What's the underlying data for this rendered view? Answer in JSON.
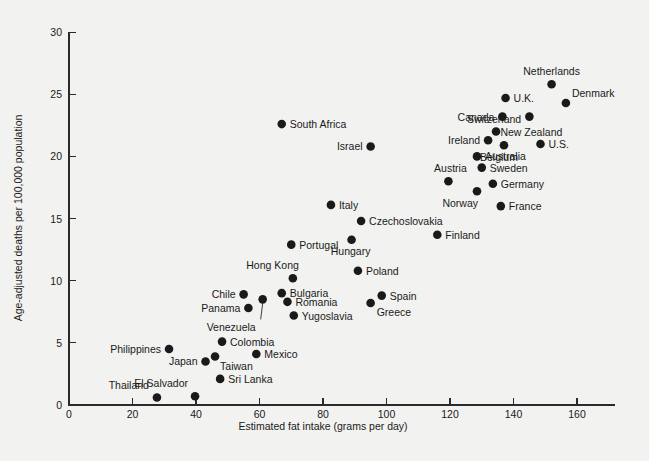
{
  "chart_data": {
    "type": "scatter",
    "title": "",
    "xlabel": "Estimated fat intake (grams per day)",
    "ylabel": "Age-adjusted deaths per 100,000 population",
    "xlim": [
      0,
      172
    ],
    "ylim": [
      0,
      30
    ],
    "xticks": [
      0,
      20,
      40,
      60,
      80,
      100,
      120,
      140,
      160
    ],
    "yticks": [
      0,
      5,
      10,
      15,
      20,
      25,
      30
    ],
    "grid": false,
    "legend": "none",
    "marker_color": "#1a1a1a",
    "background_color": "#f2f2f0",
    "points": [
      {
        "label": "Thailand",
        "x": 27.7,
        "y": 0.6,
        "lx": -8,
        "ly": -9,
        "anchor": "end"
      },
      {
        "label": "El Salvador",
        "x": 39.7,
        "y": 0.7,
        "lx": -7,
        "ly": -9,
        "anchor": "end"
      },
      {
        "label": "Sri Lanka",
        "x": 47.6,
        "y": 2.1,
        "lx": 8,
        "ly": 4,
        "anchor": "start"
      },
      {
        "label": "Japan",
        "x": 43.0,
        "y": 3.5,
        "lx": -8,
        "ly": 4,
        "anchor": "end"
      },
      {
        "label": "Taiwan",
        "x": 46.0,
        "y": 3.9,
        "lx": 5,
        "ly": 13,
        "anchor": "start"
      },
      {
        "label": "Mexico",
        "x": 59.0,
        "y": 4.1,
        "lx": 8,
        "ly": 4,
        "anchor": "start"
      },
      {
        "label": "Philippines",
        "x": 31.5,
        "y": 4.5,
        "lx": -8,
        "ly": 4,
        "anchor": "end"
      },
      {
        "label": "Colombia",
        "x": 48.2,
        "y": 5.1,
        "lx": 8,
        "ly": 4,
        "anchor": "start"
      },
      {
        "label": "Yugoslavia",
        "x": 70.8,
        "y": 7.2,
        "lx": 8,
        "ly": 4,
        "anchor": "start"
      },
      {
        "label": "Panama",
        "x": 56.5,
        "y": 7.8,
        "lx": -8,
        "ly": 4,
        "anchor": "end"
      },
      {
        "label": "Venezuela",
        "x": 61.0,
        "y": 8.5,
        "lx": -7,
        "ly": 32,
        "anchor": "end",
        "leader": true
      },
      {
        "label": "Romania",
        "x": 68.8,
        "y": 8.3,
        "lx": 8,
        "ly": 4,
        "anchor": "start"
      },
      {
        "label": "Chile",
        "x": 55.0,
        "y": 8.9,
        "lx": -8,
        "ly": 4,
        "anchor": "end"
      },
      {
        "label": "Bulgaria",
        "x": 67.0,
        "y": 9.0,
        "lx": 8,
        "ly": 4,
        "anchor": "start"
      },
      {
        "label": "Greece",
        "x": 95.0,
        "y": 8.2,
        "lx": 6,
        "ly": 13,
        "anchor": "start"
      },
      {
        "label": "Spain",
        "x": 98.5,
        "y": 8.8,
        "lx": 8,
        "ly": 4,
        "anchor": "start"
      },
      {
        "label": "Hong Kong",
        "x": 70.5,
        "y": 10.2,
        "lx": 6,
        "ly": -9,
        "anchor": "end"
      },
      {
        "label": "Poland",
        "x": 91.0,
        "y": 10.8,
        "lx": 8,
        "ly": 4,
        "anchor": "start"
      },
      {
        "label": "Portugal",
        "x": 70.0,
        "y": 12.9,
        "lx": 8,
        "ly": 4,
        "anchor": "start"
      },
      {
        "label": "Hungary",
        "x": 89.0,
        "y": 13.3,
        "lx": -1,
        "ly": 15,
        "anchor": "middle"
      },
      {
        "label": "Finland",
        "x": 116.0,
        "y": 13.7,
        "lx": 8,
        "ly": 4,
        "anchor": "start"
      },
      {
        "label": "Czechoslovakia",
        "x": 92.0,
        "y": 14.8,
        "lx": 8,
        "ly": 4,
        "anchor": "start"
      },
      {
        "label": "Italy",
        "x": 82.5,
        "y": 16.1,
        "lx": 8,
        "ly": 4,
        "anchor": "start"
      },
      {
        "label": "France",
        "x": 136.0,
        "y": 16.0,
        "lx": 8,
        "ly": 4,
        "anchor": "start"
      },
      {
        "label": "Norway",
        "x": 128.5,
        "y": 17.2,
        "lx": 1,
        "ly": 16,
        "anchor": "end"
      },
      {
        "label": "Germany",
        "x": 133.5,
        "y": 17.8,
        "lx": 8,
        "ly": 4,
        "anchor": "start"
      },
      {
        "label": "Austria",
        "x": 119.5,
        "y": 18.0,
        "lx": 2,
        "ly": -9,
        "anchor": "middle"
      },
      {
        "label": "Sweden",
        "x": 130.0,
        "y": 19.1,
        "lx": 8,
        "ly": 4,
        "anchor": "start"
      },
      {
        "label": "Australia",
        "x": 128.5,
        "y": 20.0,
        "lx": 8,
        "ly": 4,
        "anchor": "start"
      },
      {
        "label": "Israel",
        "x": 95.0,
        "y": 20.8,
        "lx": -8,
        "ly": 4,
        "anchor": "end"
      },
      {
        "label": "Belgium",
        "x": 137.0,
        "y": 20.9,
        "lx": -5,
        "ly": 16,
        "anchor": "middle"
      },
      {
        "label": "U.S.",
        "x": 148.5,
        "y": 21.0,
        "lx": 8,
        "ly": 4,
        "anchor": "start"
      },
      {
        "label": "Ireland",
        "x": 132.0,
        "y": 21.3,
        "lx": -8,
        "ly": 4,
        "anchor": "end"
      },
      {
        "label": "Switzerland",
        "x": 134.5,
        "y": 22.0,
        "lx": -2,
        "ly": -9,
        "anchor": "middle"
      },
      {
        "label": "South Africa",
        "x": 67.0,
        "y": 22.6,
        "lx": 8,
        "ly": 4,
        "anchor": "start"
      },
      {
        "label": "New Zealand",
        "x": 145.0,
        "y": 23.2,
        "lx": 2,
        "ly": 19,
        "anchor": "middle"
      },
      {
        "label": "Canada",
        "x": 136.5,
        "y": 23.2,
        "lx": -8,
        "ly": 4,
        "anchor": "end"
      },
      {
        "label": "Denmark",
        "x": 156.5,
        "y": 24.3,
        "lx": 6,
        "ly": -6,
        "anchor": "start"
      },
      {
        "label": "U.K.",
        "x": 137.5,
        "y": 24.7,
        "lx": 8,
        "ly": 4,
        "anchor": "start"
      },
      {
        "label": "Netherlands",
        "x": 152.0,
        "y": 25.8,
        "lx": 0,
        "ly": -9,
        "anchor": "middle"
      }
    ]
  }
}
